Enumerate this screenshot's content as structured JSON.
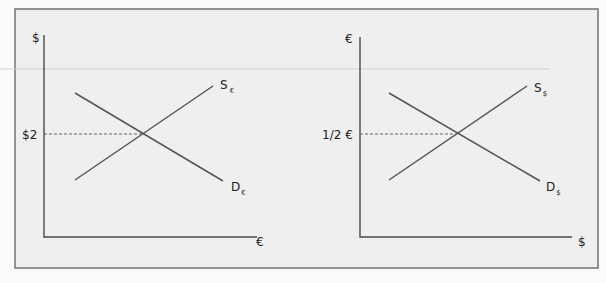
{
  "figure": {
    "left_panel": {
      "y_axis_label": "$",
      "x_axis_label": "€",
      "price_label": "$2",
      "supply_label": {
        "main": "S",
        "sub": "€"
      },
      "demand_label": {
        "main": "D",
        "sub": "€"
      }
    },
    "right_panel": {
      "y_axis_label": "€",
      "x_axis_label": "$",
      "price_label": "1/2 €",
      "supply_label": {
        "main": "S",
        "sub": "$"
      },
      "demand_label": {
        "main": "D",
        "sub": "$"
      }
    }
  },
  "colors": {
    "background": "#efefef",
    "frame": "#7a7a7a",
    "lines": "#555555"
  }
}
